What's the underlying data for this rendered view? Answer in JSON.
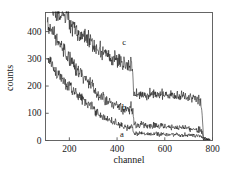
{
  "figure": {
    "background": "#ffffff",
    "line_color": "#111111",
    "axis_color": "#555555"
  },
  "chart_data": {
    "type": "line",
    "title": "",
    "xlabel": "channel",
    "ylabel": "counts",
    "xlim": [
      100,
      800
    ],
    "ylim": [
      0,
      470
    ],
    "xticks": [
      200,
      400,
      600,
      800
    ],
    "yticks": [
      0,
      100,
      200,
      300,
      400
    ],
    "grid": false,
    "legend": "inline-curve-labels",
    "annotations": [
      {
        "text": "a",
        "x": 420,
        "y": 12
      },
      {
        "text": "b",
        "x": 430,
        "y": 112
      },
      {
        "text": "c",
        "x": 430,
        "y": 352
      }
    ],
    "series": [
      {
        "name": "a",
        "label": "a",
        "x": [
          110,
          130,
          150,
          170,
          190,
          210,
          230,
          250,
          270,
          290,
          300,
          310,
          330,
          350,
          370,
          390,
          410,
          430,
          450,
          460,
          465,
          470,
          480,
          500,
          530,
          560,
          600,
          640,
          680,
          720,
          750,
          758,
          762,
          790
        ],
        "y": [
          300,
          272,
          248,
          228,
          208,
          190,
          172,
          156,
          142,
          128,
          124,
          104,
          96,
          84,
          74,
          66,
          58,
          52,
          46,
          55,
          44,
          28,
          26,
          25,
          24,
          23,
          22,
          21,
          20,
          19,
          18,
          14,
          4,
          2
        ]
      },
      {
        "name": "b",
        "label": "b",
        "x": [
          108,
          130,
          150,
          170,
          190,
          210,
          230,
          250,
          270,
          290,
          300,
          310,
          330,
          350,
          370,
          390,
          410,
          430,
          450,
          460,
          466,
          472,
          480,
          500,
          530,
          560,
          600,
          640,
          680,
          720,
          750,
          757,
          762,
          790
        ],
        "y": [
          432,
          398,
          368,
          340,
          312,
          288,
          264,
          242,
          222,
          204,
          200,
          172,
          162,
          150,
          140,
          132,
          124,
          118,
          112,
          124,
          106,
          62,
          60,
          58,
          56,
          54,
          52,
          49,
          46,
          42,
          38,
          30,
          6,
          3
        ]
      },
      {
        "name": "c",
        "label": "c",
        "x": [
          112,
          130,
          150,
          170,
          190,
          210,
          230,
          245,
          255,
          270,
          290,
          310,
          330,
          350,
          370,
          390,
          410,
          430,
          450,
          458,
          464,
          470,
          480,
          500,
          530,
          560,
          600,
          640,
          680,
          720,
          745,
          755,
          762,
          790
        ],
        "y": [
          488,
          470,
          452,
          470,
          448,
          428,
          408,
          372,
          396,
          378,
          360,
          344,
          330,
          318,
          306,
          298,
          290,
          284,
          280,
          286,
          262,
          176,
          172,
          170,
          168,
          170,
          166,
          164,
          162,
          158,
          150,
          120,
          10,
          4
        ]
      }
    ]
  },
  "axes": {
    "x_tick_labels": [
      "200",
      "400",
      "600",
      "800"
    ],
    "y_tick_labels": [
      "0",
      "100",
      "200",
      "300",
      "400"
    ],
    "x_axis_title": "channel",
    "y_axis_title": "counts"
  }
}
